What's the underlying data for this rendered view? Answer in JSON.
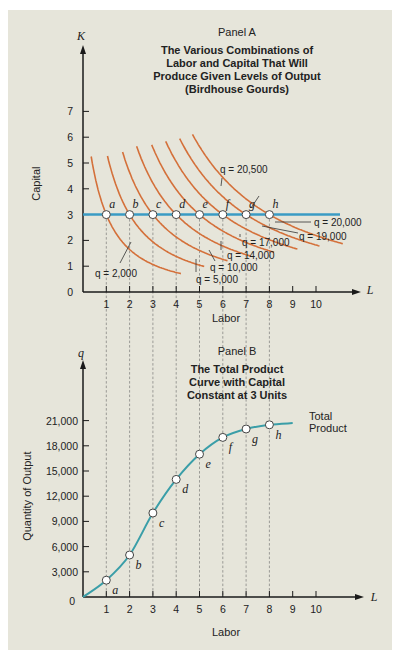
{
  "colors": {
    "background": "#e6e5da",
    "isoquant": "#d4703a",
    "capital_line": "#3a9bc4",
    "total_product": "#3a9ea8",
    "axis": "#1a1a1a",
    "guide": "#666666"
  },
  "chart_data": [
    {
      "type": "line",
      "panel": "Panel A",
      "title": "The Various Combinations of Labor and Capital That Will Produce Given Levels of Output (Birdhouse Gourds)",
      "title_lines": [
        "The Various Combinations of",
        "Labor and Capital That Will",
        "Produce Given Levels of Output",
        "(Birdhouse Gourds)"
      ],
      "xlabel": "Labor",
      "ylabel": "Capital",
      "x_axis_symbol": "L",
      "y_axis_symbol": "K",
      "x_ticks": [
        1,
        2,
        3,
        4,
        5,
        6,
        7,
        8,
        9,
        10
      ],
      "y_ticks": [
        0,
        1,
        2,
        3,
        4,
        5,
        6,
        7
      ],
      "xlim": [
        0,
        11.5
      ],
      "ylim": [
        0,
        8
      ],
      "capital_constant": 3,
      "points": [
        {
          "label": "a",
          "L": 1,
          "K": 3
        },
        {
          "label": "b",
          "L": 2,
          "K": 3
        },
        {
          "label": "c",
          "L": 3,
          "K": 3
        },
        {
          "label": "d",
          "L": 4,
          "K": 3
        },
        {
          "label": "e",
          "L": 5,
          "K": 3
        },
        {
          "label": "f",
          "L": 6,
          "K": 3
        },
        {
          "label": "g",
          "L": 7,
          "K": 3
        },
        {
          "label": "h",
          "L": 8,
          "K": 3
        }
      ],
      "isoquants": [
        {
          "q": 2000,
          "label": "q = 2,000",
          "through_L": 1
        },
        {
          "q": 5000,
          "label": "q = 5,000",
          "through_L": 2
        },
        {
          "q": 10000,
          "label": "q = 10,000",
          "through_L": 3
        },
        {
          "q": 14000,
          "label": "q = 14,000",
          "through_L": 4
        },
        {
          "q": 17000,
          "label": "q = 17,000",
          "through_L": 5
        },
        {
          "q": 19000,
          "label": "q = 19,000",
          "through_L": 6
        },
        {
          "q": 20000,
          "label": "q = 20,000",
          "through_L": 7
        },
        {
          "q": 20500,
          "label": "q = 20,500",
          "through_L": 8
        }
      ],
      "grid": false
    },
    {
      "type": "line",
      "panel": "Panel B",
      "title": "The Total Product Curve with Capital Constant at 3 Units",
      "title_lines": [
        "The Total Product",
        "Curve with Capital",
        "Constant at  3  Units"
      ],
      "xlabel": "Labor",
      "ylabel": "Quantity of Output",
      "x_axis_symbol": "L",
      "y_axis_symbol": "q",
      "x_ticks": [
        1,
        2,
        3,
        4,
        5,
        6,
        7,
        8,
        9,
        10
      ],
      "y_ticks": [
        0,
        3000,
        6000,
        9000,
        12000,
        15000,
        18000,
        21000
      ],
      "y_tick_labels": [
        "0",
        "3,000",
        "6,000",
        "9,000",
        "12,000",
        "15,000",
        "18,000",
        "21,000"
      ],
      "xlim": [
        0,
        11.5
      ],
      "ylim": [
        0,
        24000
      ],
      "series": [
        {
          "name": "Total Product",
          "x": [
            0,
            1,
            2,
            3,
            4,
            5,
            6,
            7,
            8,
            9
          ],
          "values": [
            0,
            2000,
            5000,
            10000,
            14000,
            17000,
            19000,
            20000,
            20500,
            20700
          ],
          "point_labels": [
            "",
            "a",
            "b",
            "c",
            "d",
            "e",
            "f",
            "g",
            "h",
            ""
          ]
        }
      ],
      "curve_label": [
        "Total",
        "Product"
      ],
      "grid": false
    }
  ]
}
